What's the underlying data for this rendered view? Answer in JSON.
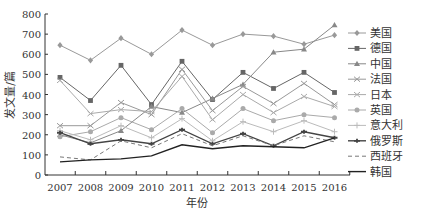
{
  "chart_data": {
    "type": "line",
    "title": "",
    "xlabel": "年份",
    "ylabel": "发文量/篇",
    "x": [
      "2007",
      "2008",
      "2009",
      "2010",
      "2011",
      "2012",
      "2013",
      "2014",
      "2015",
      "2016"
    ],
    "ylim": [
      0,
      800
    ],
    "yticks": [
      0,
      100,
      200,
      300,
      400,
      500,
      600,
      700,
      800
    ],
    "grid": false,
    "legend_position": "right",
    "series": [
      {
        "name": "美国",
        "marker": "diamond",
        "dash": "",
        "color": "#999999",
        "values": [
          645,
          570,
          680,
          600,
          720,
          645,
          700,
          690,
          650,
          695
        ]
      },
      {
        "name": "德国",
        "marker": "square",
        "dash": "",
        "color": "#666666",
        "values": [
          485,
          370,
          545,
          350,
          565,
          375,
          510,
          430,
          510,
          410
        ]
      },
      {
        "name": "中国",
        "marker": "triangle",
        "dash": "",
        "color": "#888888",
        "values": [
          200,
          160,
          220,
          340,
          310,
          380,
          450,
          610,
          625,
          745
        ]
      },
      {
        "name": "法国",
        "marker": "x",
        "dash": "",
        "color": "#999999",
        "values": [
          245,
          245,
          360,
          300,
          525,
          320,
          440,
          355,
          455,
          350
        ]
      },
      {
        "name": "日本",
        "marker": "x",
        "dash": "",
        "color": "#aaaaaa",
        "values": [
          470,
          305,
          325,
          315,
          490,
          275,
          400,
          310,
          390,
          340
        ]
      },
      {
        "name": "英国",
        "marker": "circle",
        "dash": "",
        "color": "#aaaaaa",
        "values": [
          190,
          215,
          285,
          225,
          330,
          210,
          330,
          270,
          300,
          285
        ]
      },
      {
        "name": "意大利",
        "marker": "plus",
        "dash": "",
        "color": "#bbbbbb",
        "values": [
          220,
          175,
          245,
          185,
          280,
          170,
          265,
          215,
          270,
          215
        ]
      },
      {
        "name": "俄罗斯",
        "marker": "star",
        "dash": "",
        "color": "#444444",
        "values": [
          210,
          155,
          175,
          155,
          225,
          155,
          205,
          145,
          215,
          185
        ]
      },
      {
        "name": "西班牙",
        "marker": "none",
        "dash": "4,3",
        "color": "#777777",
        "values": [
          90,
          75,
          170,
          135,
          205,
          145,
          195,
          145,
          195,
          165
        ]
      },
      {
        "name": "韩国",
        "marker": "none",
        "dash": "",
        "color": "#222222",
        "values": [
          65,
          75,
          80,
          95,
          150,
          130,
          145,
          140,
          135,
          185
        ]
      }
    ]
  },
  "axes": {
    "xlabel": "年份",
    "ylabel": "发文量/篇"
  },
  "legend": {
    "items": [
      "美国",
      "德国",
      "中国",
      "法国",
      "日本",
      "英国",
      "意大利",
      "俄罗斯",
      "西班牙",
      "韩国"
    ]
  }
}
